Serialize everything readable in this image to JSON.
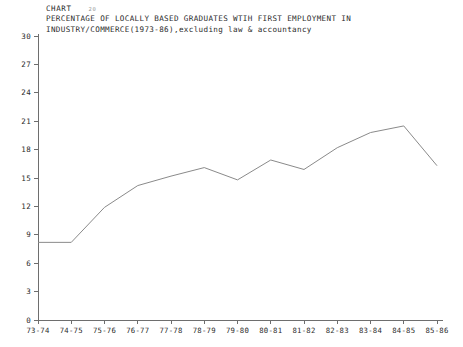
{
  "header": {
    "chart_word": "CHART",
    "chart_number": "20",
    "title_line_1": "PERCENTAGE OF LOCALLY BASED GRADUATES WTIH FIRST EMPLOYMENT IN",
    "title_line_2": "INDUSTRY/COMMERCE(1973-86),excluding law & accountancy"
  },
  "colors": {
    "line": "#8a8a8a",
    "axis": "#6e6e6e",
    "text": "#2b2b2b",
    "background": "#ffffff"
  },
  "chart_data": {
    "type": "line",
    "title": "PERCENTAGE OF LOCALLY BASED GRADUATES WTIH FIRST EMPLOYMENT IN INDUSTRY/COMMERCE(1973-86),excluding law & accountancy",
    "xlabel": "",
    "ylabel": "",
    "categories": [
      "73-74",
      "74-75",
      "75-76",
      "76-77",
      "77-78",
      "78-79",
      "79-80",
      "80-81",
      "81-82",
      "82-83",
      "83-84",
      "84-85",
      "85-86"
    ],
    "values": [
      8.2,
      8.2,
      11.9,
      14.2,
      15.2,
      16.1,
      14.8,
      16.9,
      15.9,
      18.2,
      19.8,
      20.5,
      16.3
    ],
    "ylim": [
      0,
      30
    ],
    "yticks": [
      0,
      3,
      6,
      9,
      12,
      15,
      18,
      21,
      24,
      27,
      30
    ],
    "ytick_labels": [
      "0",
      "3",
      "6",
      "9",
      "12",
      "15",
      "18",
      "21",
      "24",
      "27",
      "30"
    ],
    "grid": false,
    "legend": false
  }
}
